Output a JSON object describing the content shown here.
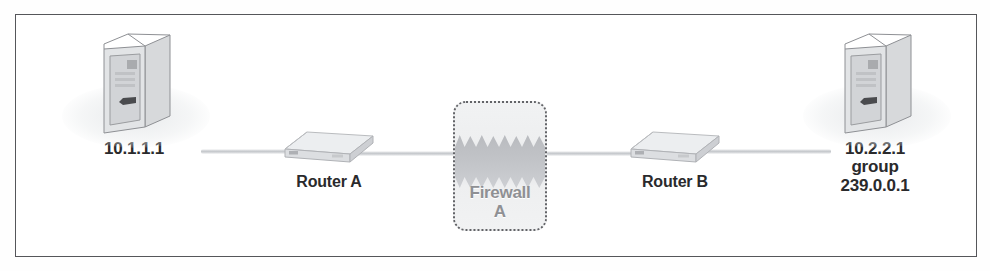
{
  "figure": {
    "kind": "network-topology-diagram",
    "frame": {
      "border_color": "#55565a",
      "background": "#ffffff"
    },
    "link_color": "#c4c7cb"
  },
  "nodes": [
    {
      "id": "host-left",
      "type": "host",
      "icon": "server-tower-icon",
      "labels": [
        "10.1.1.1"
      ]
    },
    {
      "id": "router-a",
      "type": "router",
      "icon": "router-icon",
      "labels": [
        "Router A"
      ]
    },
    {
      "id": "firewall-a",
      "type": "firewall",
      "icon": "firewall-icon",
      "name": "Firewall",
      "designator": "A",
      "labels": [
        "Firewall",
        "A"
      ],
      "text_color": "#8f9094",
      "border_style": "dotted"
    },
    {
      "id": "router-b",
      "type": "router",
      "icon": "router-icon",
      "labels": [
        "Router B"
      ]
    },
    {
      "id": "host-right",
      "type": "host",
      "icon": "server-tower-icon",
      "labels": [
        "10.2.2.1",
        "group",
        "239.0.0.1"
      ]
    }
  ],
  "links": [
    {
      "from": "host-left",
      "to": "router-a"
    },
    {
      "from": "router-a",
      "to": "firewall-a"
    },
    {
      "from": "firewall-a",
      "to": "router-b"
    },
    {
      "from": "router-b",
      "to": "host-right"
    }
  ],
  "text": {
    "host_left_ip": "10.1.1.1",
    "router_a": "Router A",
    "firewall_name": "Firewall",
    "firewall_id": "A",
    "router_b": "Router B",
    "host_right_ip": "10.2.2.1",
    "host_right_group_word": "group",
    "host_right_group_addr": "239.0.0.1"
  }
}
